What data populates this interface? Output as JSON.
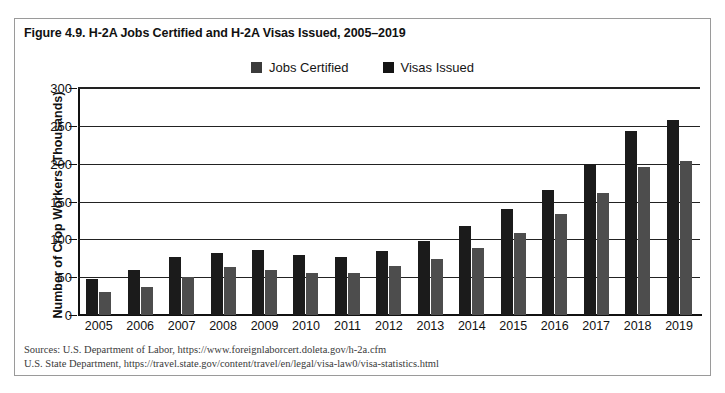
{
  "figure": {
    "title": "Figure 4.9. H-2A Jobs Certified and H-2A Visas Issued, 2005–2019"
  },
  "legend": {
    "position": "top-center",
    "items": [
      {
        "label": "Jobs Certified",
        "color": "#1b1b1b",
        "swatch": "legend-swatch-jobs-certified"
      },
      {
        "label": "Visas Issued",
        "color": "#1b1b1b",
        "swatch": "legend-swatch-visas-issued"
      }
    ]
  },
  "sources": {
    "line1": "Sources: U.S. Department of Labor, https://www.foreignlaborcert.doleta.gov/h-2a.cfm",
    "line2": "U.S. State Department, https://travel.state.gov/content/travel/en/legal/visa-law0/visa-statistics.html"
  },
  "chart_data": {
    "type": "bar",
    "title": "Figure 4.9. H-2A Jobs Certified and H-2A Visas Issued, 2005–2019",
    "xlabel": "",
    "ylabel": "Number of Crop Workers (Thousands)",
    "ylim": [
      0,
      300
    ],
    "yticks": [
      0,
      50,
      100,
      150,
      200,
      250,
      300
    ],
    "grid": true,
    "legend_position": "top-center",
    "categories": [
      "2005",
      "2006",
      "2007",
      "2008",
      "2009",
      "2010",
      "2011",
      "2012",
      "2013",
      "2014",
      "2015",
      "2016",
      "2017",
      "2018",
      "2019"
    ],
    "series": [
      {
        "name": "Jobs Certified",
        "color": "#1b1b1b",
        "values": [
          47,
          59,
          77,
          82,
          86,
          79,
          77,
          85,
          98,
          117,
          140,
          165,
          200,
          243,
          258
        ]
      },
      {
        "name": "Visas Issued",
        "color": "#4d4d4d",
        "values": [
          31,
          37,
          50,
          64,
          60,
          55,
          55,
          65,
          74,
          89,
          108,
          134,
          161,
          196,
          204
        ]
      }
    ]
  }
}
